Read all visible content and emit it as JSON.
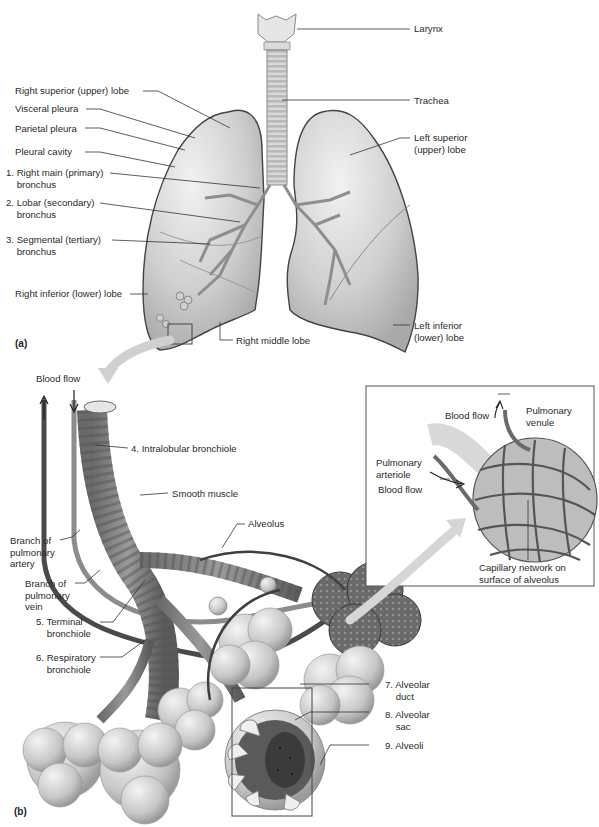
{
  "figure": {
    "panel_a": {
      "tag": "(a)",
      "labels": {
        "larynx": "Larynx",
        "trachea": "Trachea",
        "right_superior_lobe": "Right superior (upper) lobe",
        "visceral_pleura": "Visceral pleura",
        "parietal_pleura": "Parietal pleura",
        "pleural_cavity": "Pleural cavity",
        "right_main_bronchus": "1. Right main (primary)\n    bronchus",
        "lobar_bronchus": "2. Lobar (secondary)\n    bronchus",
        "segmental_bronchus": "3. Segmental (tertiary)\n    bronchus",
        "right_inferior_lobe": "Right inferior (lower) lobe",
        "right_middle_lobe": "Right middle lobe",
        "left_superior_lobe": "Left superior\n(upper) lobe",
        "left_inferior_lobe": "Left inferior\n(lower) lobe"
      }
    },
    "panel_b": {
      "tag": "(b)",
      "labels": {
        "blood_flow_top": "Blood flow",
        "intralobular_bronchiole": "4. Intralobular bronchiole",
        "smooth_muscle": "Smooth muscle",
        "alveolus": "Alveolus",
        "branch_pulmonary_artery": "Branch of\npulmonary\nartery",
        "branch_pulmonary_vein": "Branch of\npulmonary\nvein",
        "terminal_bronchiole": "5. Terminal\n    bronchiole",
        "respiratory_bronchiole": "6. Respiratory\n    bronchiole",
        "alveolar_duct": "7. Alveolar\n    duct",
        "alveolar_sac": "8. Alveolar\n    sac",
        "alveoli": "9. Alveoli"
      },
      "inset": {
        "blood_flow_out": "Blood flow",
        "pulmonary_venule": "Pulmonary\nvenule",
        "pulmonary_arteriole": "Pulmonary\narteriole",
        "blood_flow_in": "Blood flow",
        "capillary_network": "Capillary network on\nsurface of alveolus"
      }
    }
  }
}
